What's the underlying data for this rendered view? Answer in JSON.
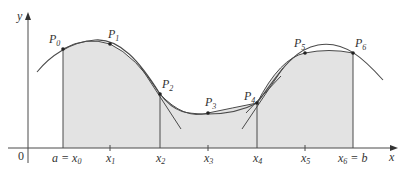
{
  "figure": {
    "colors": {
      "shade": "#e3e3e3",
      "line": "#4a4a4a",
      "text": "#333333"
    },
    "axes": {
      "origin_label": "0",
      "x_label": "x",
      "y_label": "y"
    },
    "x_ticks": [
      {
        "main": "a = x",
        "sub": "0"
      },
      {
        "main": "x",
        "sub": "1"
      },
      {
        "main": "x",
        "sub": "2"
      },
      {
        "main": "x",
        "sub": "3"
      },
      {
        "main": "x",
        "sub": "4"
      },
      {
        "main": "x",
        "sub": "5"
      },
      {
        "main": "x",
        "sub": "6",
        "suffix": " = b"
      }
    ],
    "points": [
      {
        "main": "P",
        "sub": "0"
      },
      {
        "main": "P",
        "sub": "1"
      },
      {
        "main": "P",
        "sub": "2"
      },
      {
        "main": "P",
        "sub": "3"
      },
      {
        "main": "P",
        "sub": "4"
      },
      {
        "main": "P",
        "sub": "5"
      },
      {
        "main": "P",
        "sub": "6"
      }
    ]
  }
}
